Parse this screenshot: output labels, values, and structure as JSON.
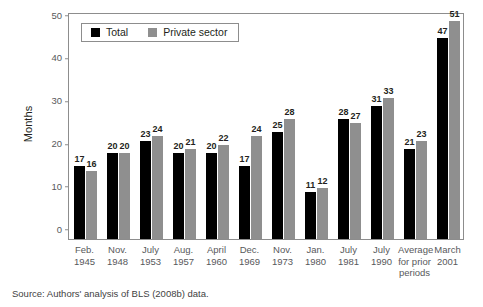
{
  "chart_data": {
    "type": "bar",
    "title": "",
    "xlabel": "",
    "ylabel": "Months",
    "ylim": [
      0,
      50
    ],
    "yticks": [
      0,
      10,
      20,
      30,
      40,
      50
    ],
    "grid": false,
    "legend_position": "top-left",
    "categories": [
      "Feb. 1945",
      "Nov. 1948",
      "July 1953",
      "Aug. 1957",
      "April 1960",
      "Dec. 1969",
      "Nov. 1973",
      "Jan. 1980",
      "July 1981",
      "July 1990",
      "Average for prior periods",
      "March 2001"
    ],
    "category_lines": [
      [
        "Feb.",
        "1945"
      ],
      [
        "Nov.",
        "1948"
      ],
      [
        "July",
        "1953"
      ],
      [
        "Aug.",
        "1957"
      ],
      [
        "April",
        "1960"
      ],
      [
        "Dec.",
        "1969"
      ],
      [
        "Nov.",
        "1973"
      ],
      [
        "Jan.",
        "1980"
      ],
      [
        "July",
        "1981"
      ],
      [
        "July",
        "1990"
      ],
      [
        "Average",
        "for prior",
        "periods"
      ],
      [
        "March",
        "2001"
      ]
    ],
    "series": [
      {
        "name": "Total",
        "color": "#000000",
        "values": [
          17,
          20,
          23,
          20,
          20,
          17,
          25,
          11,
          28,
          31,
          21,
          47
        ]
      },
      {
        "name": "Private sector",
        "color": "#8f8f8f",
        "values": [
          16,
          20,
          24,
          21,
          22,
          24,
          28,
          12,
          27,
          33,
          23,
          51
        ]
      }
    ]
  },
  "legend": {
    "entries": [
      {
        "label": "Total",
        "swatch": "total-swatch"
      },
      {
        "label": "Private sector",
        "swatch": "private-sector-swatch"
      }
    ]
  },
  "axes": {
    "y_title": "Months",
    "y_ticks": [
      "0",
      "10",
      "20",
      "30",
      "40",
      "50"
    ]
  },
  "footer": {
    "source": "Source: Authors' analysis of BLS (2008b) data."
  }
}
